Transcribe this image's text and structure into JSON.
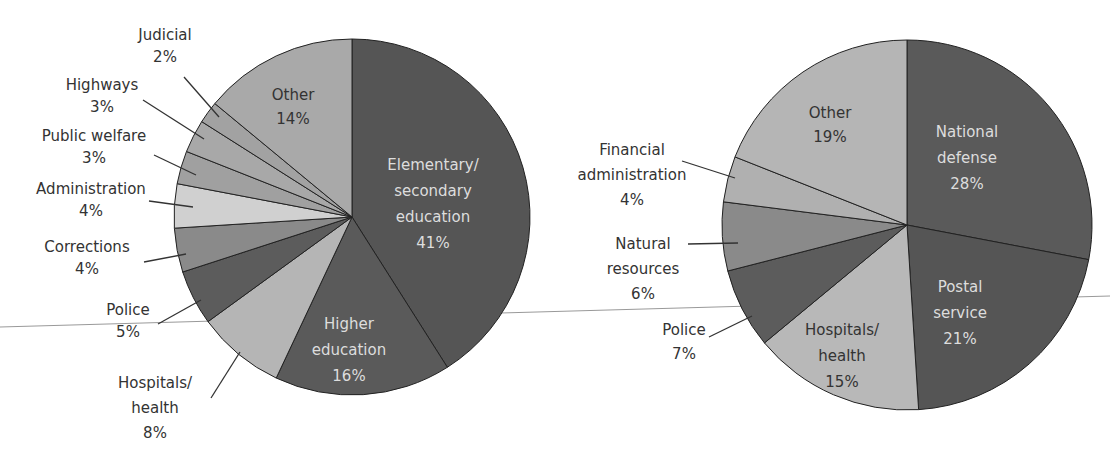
{
  "chart_data": [
    {
      "type": "pie",
      "title": "",
      "slices": [
        {
          "label": "Elementary/ secondary education",
          "value": 41
        },
        {
          "label": "Higher education",
          "value": 16
        },
        {
          "label": "Hospitals/ health",
          "value": 8
        },
        {
          "label": "Police",
          "value": 5
        },
        {
          "label": "Corrections",
          "value": 4
        },
        {
          "label": "Administration",
          "value": 4
        },
        {
          "label": "Public welfare",
          "value": 3
        },
        {
          "label": "Highways",
          "value": 3
        },
        {
          "label": "Judicial",
          "value": 2
        },
        {
          "label": "Other",
          "value": 14
        }
      ]
    },
    {
      "type": "pie",
      "title": "",
      "slices": [
        {
          "label": "National defense",
          "value": 28
        },
        {
          "label": "Postal service",
          "value": 21
        },
        {
          "label": "Hospitals/ health",
          "value": 15
        },
        {
          "label": "Police",
          "value": 7
        },
        {
          "label": "Natural resources",
          "value": 6
        },
        {
          "label": "Financial administration",
          "value": 4
        },
        {
          "label": "Other",
          "value": 19
        }
      ]
    }
  ],
  "left": {
    "labels": {
      "judicial": [
        "Judicial",
        "2%"
      ],
      "highways": [
        "Highways",
        "3%"
      ],
      "welfare": [
        "Public welfare",
        "3%"
      ],
      "admin": [
        "Administration",
        "4%"
      ],
      "corrections": [
        "Corrections",
        "4%"
      ],
      "police": [
        "Police",
        "5%"
      ],
      "hospitals": [
        "Hospitals/",
        "health",
        "8%"
      ],
      "higher": [
        "Higher",
        "education",
        "16%"
      ],
      "elementary": [
        "Elementary/",
        "secondary",
        "education",
        "41%"
      ],
      "other": [
        "Other",
        "14%"
      ]
    }
  },
  "right": {
    "labels": {
      "defense": [
        "National",
        "defense",
        "28%"
      ],
      "postal": [
        "Postal",
        "service",
        "21%"
      ],
      "hospitals": [
        "Hospitals/",
        "health",
        "15%"
      ],
      "police": [
        "Police",
        "7%"
      ],
      "natural": [
        "Natural",
        "resources",
        "6%"
      ],
      "financial": [
        "Financial",
        "administration",
        "4%"
      ],
      "other": [
        "Other",
        "19%"
      ]
    }
  }
}
